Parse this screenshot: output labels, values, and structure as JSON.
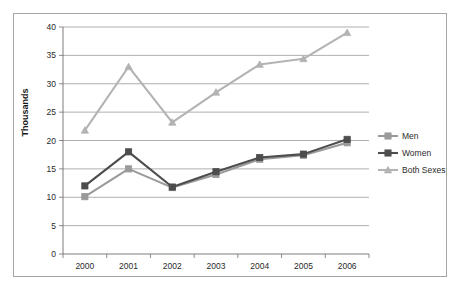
{
  "chart_data": {
    "type": "line",
    "title": "",
    "xlabel": "",
    "ylabel": "Thousands",
    "categories": [
      "2000",
      "2001",
      "2002",
      "2003",
      "2004",
      "2005",
      "2006"
    ],
    "ylim": [
      0,
      40
    ],
    "ytick_step": 5,
    "yticks": [
      "0",
      "5",
      "10",
      "15",
      "20",
      "25",
      "30",
      "35",
      "40"
    ],
    "grid": "horizontal",
    "legend_position": "right",
    "series": [
      {
        "name": "Men",
        "color": "#9a9a9a",
        "marker": "square",
        "values": [
          10.1,
          15.0,
          11.7,
          14.0,
          16.7,
          17.4,
          19.6
        ]
      },
      {
        "name": "Women",
        "color": "#4d4d4d",
        "marker": "square",
        "values": [
          12.0,
          18.0,
          11.8,
          14.5,
          17.0,
          17.6,
          20.2
        ]
      },
      {
        "name": "Both Sexes",
        "color": "#b3b3b3",
        "marker": "triangle",
        "values": [
          21.8,
          33.0,
          23.2,
          28.5,
          33.4,
          34.4,
          39.0
        ]
      }
    ]
  },
  "legend": {
    "items": [
      {
        "label": "Men"
      },
      {
        "label": "Women"
      },
      {
        "label": "Both Sexes"
      }
    ]
  }
}
